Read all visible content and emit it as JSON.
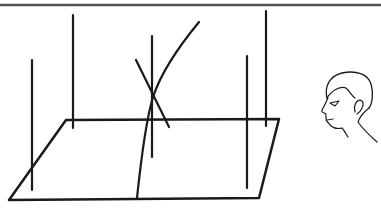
{
  "figure": {
    "description": "Perspective line drawing: a ground plane with vertical poles and crossing sticks, viewed by an observer (head in profile) on the right",
    "colors": {
      "background": "#ffffff",
      "line": "#1a1a1a",
      "border": "#555555"
    },
    "border_top": {
      "x1": 0,
      "y1": 5,
      "x2": 381,
      "y2": 5,
      "width": 2.5
    },
    "plane": {
      "points": [
        [
          66,
          120
        ],
        [
          279,
          119
        ],
        [
          259,
          198
        ],
        [
          9,
          200
        ]
      ],
      "stroke_width": 2.5
    },
    "poles": [
      {
        "id": "pole-1",
        "x": 32,
        "y1": 60,
        "y2": 190
      },
      {
        "id": "pole-2",
        "x": 73,
        "y1": 15,
        "y2": 128
      },
      {
        "id": "pole-3",
        "x": 152,
        "y1": 36,
        "y2": 157
      },
      {
        "id": "pole-4",
        "x": 247,
        "y1": 56,
        "y2": 188
      },
      {
        "id": "pole-5",
        "x": 266,
        "y1": 11,
        "y2": 126
      }
    ],
    "sticks": [
      {
        "id": "curved-stick",
        "path": "M137 198 C 141 160, 146 120, 153 97 C 162 70, 180 45, 199 22"
      },
      {
        "id": "diagonal-stick",
        "x1": 136,
        "y1": 60,
        "x2": 169,
        "y2": 127
      }
    ],
    "observer": {
      "label": "observer-head",
      "position": [
        318,
        72
      ]
    }
  }
}
